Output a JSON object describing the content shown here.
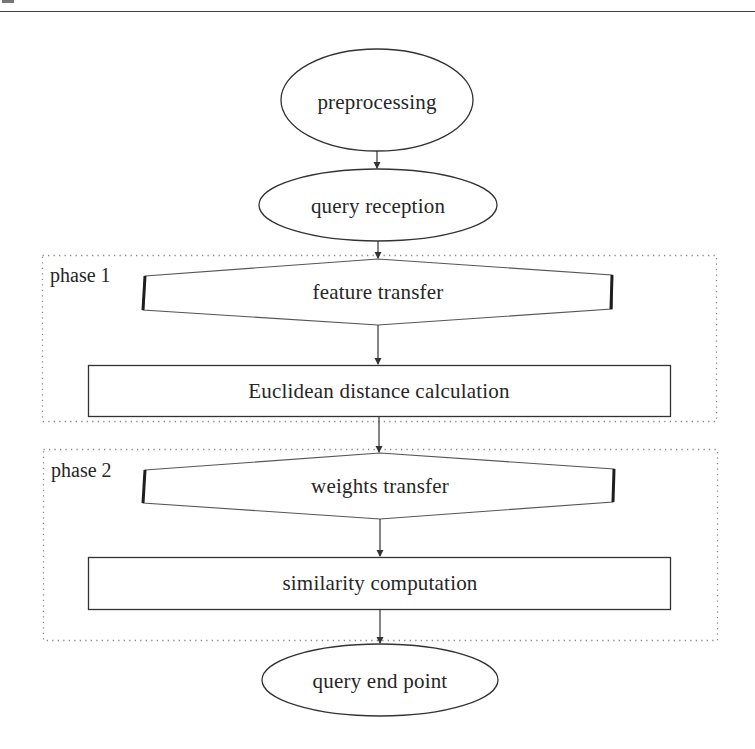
{
  "diagram": {
    "title": "",
    "phases": [
      {
        "id": "phase1",
        "label": "phase 1"
      },
      {
        "id": "phase2",
        "label": "phase 2"
      }
    ],
    "nodes": [
      {
        "id": "preprocessing",
        "shape": "ellipse",
        "label": "preprocessing"
      },
      {
        "id": "query_reception",
        "shape": "ellipse",
        "label": "query reception"
      },
      {
        "id": "feature_transfer",
        "shape": "hexagon",
        "label": "feature transfer",
        "phase": "phase1"
      },
      {
        "id": "euclidean",
        "shape": "rectangle",
        "label": "Euclidean distance calculation",
        "phase": "phase1"
      },
      {
        "id": "weights_transfer",
        "shape": "hexagon",
        "label": "weights transfer",
        "phase": "phase2"
      },
      {
        "id": "similarity",
        "shape": "rectangle",
        "label": "similarity computation",
        "phase": "phase2"
      },
      {
        "id": "query_end",
        "shape": "ellipse",
        "label": "query end point"
      }
    ],
    "edges": [
      {
        "from": "preprocessing",
        "to": "query_reception"
      },
      {
        "from": "query_reception",
        "to": "feature_transfer"
      },
      {
        "from": "feature_transfer",
        "to": "euclidean"
      },
      {
        "from": "euclidean",
        "to": "weights_transfer"
      },
      {
        "from": "weights_transfer",
        "to": "similarity"
      },
      {
        "from": "similarity",
        "to": "query_end"
      }
    ]
  },
  "colors": {
    "stroke": "#333333",
    "dotted_border": "#8a8a8a",
    "text": "#262626",
    "background": "#ffffff"
  }
}
